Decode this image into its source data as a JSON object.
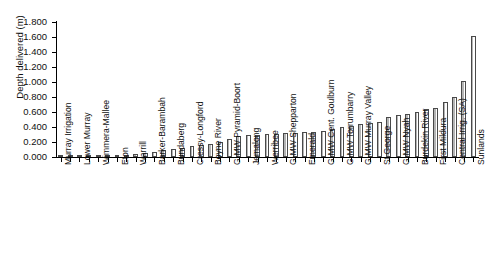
{
  "chart_data": {
    "type": "bar",
    "title": "",
    "xlabel": "",
    "ylabel": "Depth delivered (m)",
    "ylim": [
      0.0,
      1.8
    ],
    "ytick_values": [
      0.0,
      0.2,
      0.4,
      0.6,
      0.8,
      1.0,
      1.2,
      1.4,
      1.6,
      1.8
    ],
    "ytick_labels": [
      "0.000",
      "0.200",
      "0.400",
      "0.600",
      "0.800",
      "1.000",
      "1.200",
      "1.400",
      "1.600",
      "1.800"
    ],
    "grid": false,
    "legend": null,
    "bar_style": {
      "fill": "#ffffff",
      "edge": "#4a4a4a"
    },
    "label_interval": 2,
    "categories": [
      "Murray Irrigation",
      "",
      "Lower Murray",
      "",
      "Wimmera-Mallee",
      "",
      "Eton",
      "",
      "Warrill",
      "",
      "Barker-Barambah",
      "",
      "Bundaberg",
      "",
      "Cressy-Longford",
      "",
      "Boyne River",
      "",
      "G-MW Pyramid-Boort",
      "",
      "Jemalong",
      "",
      "Werribee",
      "",
      "G-MW Shepparton",
      "",
      "Emerald",
      "",
      "G-MW Cent. Goulburn",
      "",
      "G-MW Torrumbarry",
      "",
      "G-MW Murray Valley",
      "",
      "St George",
      "",
      "G-MW Nyah",
      "",
      "Burdekin River",
      "",
      "First Mildura",
      "",
      "Central Irrig. (SA)",
      "",
      "Sunlands"
    ],
    "values": [
      0.002,
      0.004,
      0.006,
      0.008,
      0.01,
      0.014,
      0.022,
      0.03,
      0.045,
      0.052,
      0.07,
      0.09,
      0.105,
      0.122,
      0.15,
      0.16,
      0.175,
      0.2,
      0.245,
      0.28,
      0.29,
      0.3,
      0.305,
      0.312,
      0.318,
      0.322,
      0.33,
      0.34,
      0.35,
      0.37,
      0.398,
      0.42,
      0.44,
      0.46,
      0.47,
      0.53,
      0.56,
      0.57,
      0.6,
      0.64,
      0.66,
      0.73,
      0.8,
      1.02,
      1.62
    ]
  }
}
